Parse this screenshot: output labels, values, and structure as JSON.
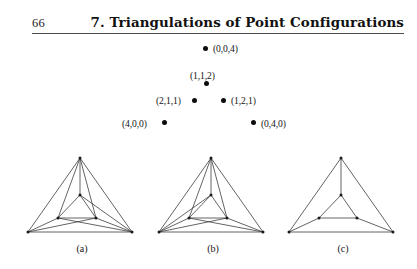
{
  "header": {
    "folio": "66",
    "title": "7. Triangulations of Point Configurations"
  },
  "point_configuration": {
    "points": [
      {
        "label": "(0,0,4)",
        "x": 0,
        "y": 0,
        "z": 4,
        "dot_x": 205,
        "dot_y": 48,
        "label_x": 213,
        "label_y": 43,
        "label_side": "right"
      },
      {
        "label": "(1,1,2)",
        "x": 1,
        "y": 1,
        "z": 2,
        "dot_x": 206,
        "dot_y": 83,
        "label_x": 190,
        "label_y": 70,
        "label_side": "above"
      },
      {
        "label": "(2,1,1)",
        "x": 2,
        "y": 1,
        "z": 1,
        "dot_x": 194,
        "dot_y": 100,
        "label_x": 156,
        "label_y": 95,
        "label_side": "left"
      },
      {
        "label": "(1,2,1)",
        "x": 1,
        "y": 2,
        "z": 1,
        "dot_x": 223,
        "dot_y": 100,
        "label_x": 231,
        "label_y": 95,
        "label_side": "right"
      },
      {
        "label": "(4,0,0)",
        "x": 4,
        "y": 0,
        "z": 0,
        "dot_x": 164,
        "dot_y": 122,
        "label_x": 122,
        "label_y": 118,
        "label_side": "left"
      },
      {
        "label": "(0,4,0)",
        "x": 0,
        "y": 4,
        "z": 0,
        "dot_x": 253,
        "dot_y": 122,
        "label_x": 261,
        "label_y": 118,
        "label_side": "right"
      }
    ]
  },
  "figures": [
    {
      "caption": "(a)",
      "name": "triangulation-a",
      "vertices": {
        "top": [
          58,
          8
        ],
        "bottom_left": [
          6,
          82
        ],
        "bottom_right": [
          110,
          82
        ],
        "inner_top": [
          58,
          45
        ],
        "inner_left": [
          36,
          68
        ],
        "inner_right": [
          74,
          68
        ]
      },
      "edges": [
        [
          "top",
          "bottom_left"
        ],
        [
          "bottom_left",
          "bottom_right"
        ],
        [
          "bottom_right",
          "top"
        ],
        [
          "inner_top",
          "inner_left"
        ],
        [
          "inner_left",
          "inner_right"
        ],
        [
          "inner_right",
          "inner_top"
        ],
        [
          "top",
          "inner_top"
        ],
        [
          "bottom_left",
          "inner_left"
        ],
        [
          "bottom_right",
          "inner_right"
        ],
        [
          "top",
          "inner_left"
        ],
        [
          "top",
          "inner_right"
        ],
        [
          "bottom_right",
          "inner_top"
        ],
        [
          "bottom_right",
          "inner_left"
        ],
        [
          "bottom_left",
          "inner_right"
        ]
      ]
    },
    {
      "caption": "(b)",
      "name": "triangulation-b",
      "vertices": {
        "top": [
          58,
          8
        ],
        "bottom_left": [
          6,
          82
        ],
        "bottom_right": [
          110,
          82
        ],
        "inner_top": [
          58,
          45
        ],
        "inner_left": [
          36,
          68
        ],
        "inner_right": [
          74,
          68
        ]
      },
      "edges": [
        [
          "top",
          "bottom_left"
        ],
        [
          "bottom_left",
          "bottom_right"
        ],
        [
          "bottom_right",
          "top"
        ],
        [
          "inner_top",
          "inner_left"
        ],
        [
          "inner_left",
          "inner_right"
        ],
        [
          "inner_right",
          "inner_top"
        ],
        [
          "top",
          "inner_top"
        ],
        [
          "bottom_left",
          "inner_left"
        ],
        [
          "bottom_right",
          "inner_right"
        ],
        [
          "top",
          "inner_left"
        ],
        [
          "top",
          "inner_right"
        ],
        [
          "bottom_left",
          "inner_top"
        ],
        [
          "bottom_left",
          "inner_right"
        ],
        [
          "bottom_right",
          "inner_left"
        ]
      ]
    },
    {
      "caption": "(c)",
      "name": "triangulation-c",
      "vertices": {
        "top": [
          58,
          8
        ],
        "bottom_left": [
          6,
          82
        ],
        "bottom_right": [
          110,
          82
        ],
        "inner_top": [
          58,
          45
        ],
        "inner_left": [
          36,
          68
        ],
        "inner_right": [
          74,
          68
        ]
      },
      "edges": [
        [
          "top",
          "bottom_left"
        ],
        [
          "bottom_left",
          "bottom_right"
        ],
        [
          "bottom_right",
          "top"
        ],
        [
          "inner_top",
          "inner_left"
        ],
        [
          "inner_left",
          "inner_right"
        ],
        [
          "inner_right",
          "inner_top"
        ],
        [
          "top",
          "inner_top"
        ],
        [
          "bottom_left",
          "inner_left"
        ],
        [
          "bottom_right",
          "inner_right"
        ]
      ]
    }
  ],
  "colors": {
    "ink": "#1a1a1a",
    "rule": "#4a4a4a",
    "line": "#3c3c3c",
    "page": "#ffffff"
  }
}
